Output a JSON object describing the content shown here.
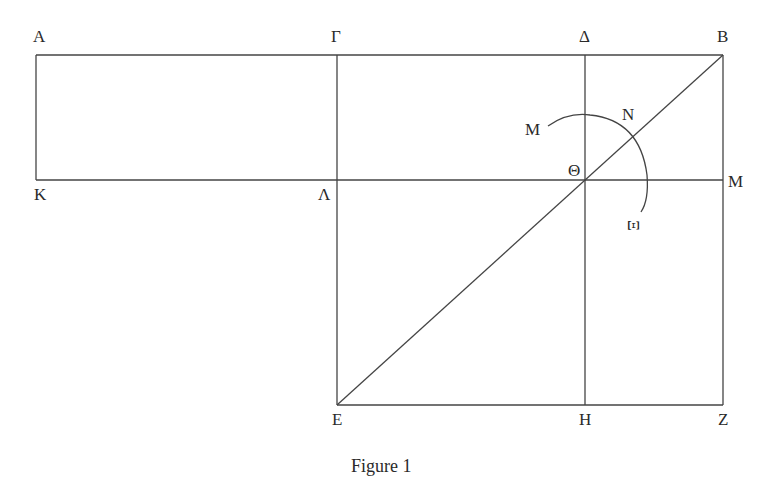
{
  "figure": {
    "caption": "Figure 1",
    "line_color": "#444444",
    "points": {
      "A": "A",
      "Gamma": "Γ",
      "Delta": "Δ",
      "B": "B",
      "K": "K",
      "Lambda": "Λ",
      "Theta": "Θ",
      "M_right": "M",
      "M_arc": "M",
      "N": "N",
      "Xi": "Ξ",
      "E": "E",
      "H": "H",
      "Z": "Z"
    }
  }
}
